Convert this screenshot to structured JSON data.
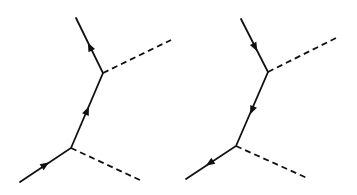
{
  "figure": {
    "type": "feynman-diagram-pair",
    "line_color": "#111111",
    "background": "#ffffff",
    "diagrams": [
      {
        "name": "left-diagram",
        "fermion_direction": "upward",
        "fermion_path": [
          [
            20,
            182
          ],
          [
            71,
            148
          ],
          [
            103,
            73
          ],
          [
            76,
            18
          ]
        ],
        "bosons": [
          {
            "from": [
              103,
              73
            ],
            "to": [
              171,
              40
            ]
          },
          {
            "from": [
              71,
              148
            ],
            "to": [
              142,
              181
            ]
          }
        ],
        "arrows": [
          {
            "at": [
              45,
              165
            ],
            "toward": [
              71,
              148
            ]
          },
          {
            "at": [
              87,
              111
            ],
            "toward": [
              103,
              73
            ]
          },
          {
            "at": [
              90,
              47
            ],
            "toward": [
              76,
              18
            ]
          }
        ]
      },
      {
        "name": "right-diagram",
        "fermion_direction": "downward",
        "fermion_path": [
          [
            241,
            19
          ],
          [
            268,
            72
          ],
          [
            236,
            146
          ],
          [
            186,
            179
          ]
        ],
        "bosons": [
          {
            "from": [
              268,
              72
            ],
            "to": [
              338,
              37
            ]
          },
          {
            "from": [
              236,
              146
            ],
            "to": [
              307,
              178
            ]
          }
        ],
        "arrows": [
          {
            "at": [
              255,
              47
            ],
            "toward": [
              268,
              72
            ]
          },
          {
            "at": [
              252,
              110
            ],
            "toward": [
              236,
              146
            ]
          },
          {
            "at": [
              210,
              163
            ],
            "toward": [
              186,
              179
            ]
          }
        ]
      }
    ]
  }
}
